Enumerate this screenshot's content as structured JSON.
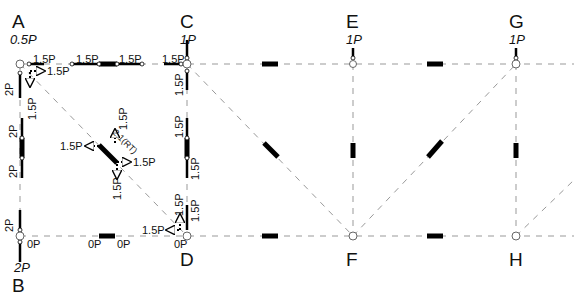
{
  "diagram": {
    "nodes": [
      {
        "id": "A",
        "label": "A",
        "load": "0.5P",
        "x": 20,
        "y": 64
      },
      {
        "id": "B",
        "label": "B",
        "load": "2P",
        "x": 20,
        "y": 236
      },
      {
        "id": "C",
        "label": "C",
        "load": "1P",
        "x": 187,
        "y": 64
      },
      {
        "id": "D",
        "label": "D",
        "load": "",
        "x": 187,
        "y": 236
      },
      {
        "id": "E",
        "label": "E",
        "load": "1P",
        "x": 353,
        "y": 64
      },
      {
        "id": "F",
        "label": "F",
        "load": "",
        "x": 353,
        "y": 236
      },
      {
        "id": "G",
        "label": "G",
        "load": "1P",
        "x": 516,
        "y": 64
      },
      {
        "id": "H",
        "label": "H",
        "load": "",
        "x": 516,
        "y": 236
      }
    ],
    "member_forces": {
      "AC_left": "1.5P",
      "AC_right": "1.5P",
      "AC_at_C": "1.5P",
      "A_top_horizontal": "1.5P",
      "A_dashed_horizontal": "1.5P",
      "A_vertical": "2P",
      "A_dashed_vertical": "1.5P",
      "AB_top": "2P",
      "AB_bottom": "2P",
      "B_vertical": "2P",
      "B_horizontal": "0P",
      "BD_left": "0P",
      "BD_right": "0P",
      "D_horizontal": "0P",
      "C_vertical": "1.5P",
      "CD_top": "1.5P",
      "CD_bottom": "1.5P",
      "D_vertical": "1.5P",
      "D_dashed_vertical": "1.5P",
      "D_dashed_horizontal": "1.5P",
      "diag_top_vertical": "1.5P",
      "diag_left": "1.5P",
      "diag_right": "1.5P",
      "diag_bottom": "1.5P",
      "diagonal_label": "2.1(RT)"
    },
    "colors": {
      "member_line": "#999999",
      "force_bar": "#000000",
      "text": "#111111"
    }
  }
}
